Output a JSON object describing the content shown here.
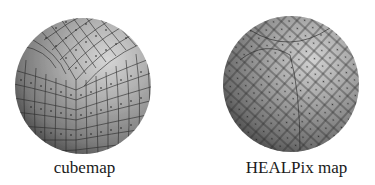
{
  "figures": [
    {
      "id": "cubemap",
      "caption": "cubemap",
      "description": "Sphere tessellated with a cube-projected quadrilateral grid; a cube corner visible near center, each cell marked with a center dot",
      "icon": "cubemap-sphere-icon"
    },
    {
      "id": "healpix",
      "caption": "HEALPix map",
      "description": "Sphere tessellated with HEALPix diamond-shaped equal-area pixels, each cell marked with a center dot",
      "icon": "healpix-sphere-icon"
    }
  ],
  "colors": {
    "background": "#ffffff",
    "sphere_highlight": "#d2d2d2",
    "sphere_mid": "#9a9a9a",
    "sphere_shadow": "#3a3a3a",
    "grid_line": "#262626",
    "caption_text": "#1a1a1a"
  }
}
